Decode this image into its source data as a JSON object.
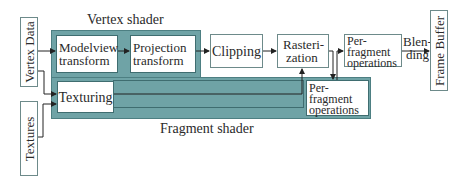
{
  "diagram": {
    "colors": {
      "shader_group_fill": "#6fa3a6",
      "shader_group_border": "#4d7f82",
      "box_fill": "#ffffff",
      "line": "#222222"
    },
    "inputs": {
      "vertex_data": "Vertex Data",
      "textures": "Textures"
    },
    "groups": {
      "vertex_shader": "Vertex shader",
      "fragment_shader": "Fragment shader"
    },
    "nodes": {
      "modelview": [
        "Modelview",
        "transform"
      ],
      "projection": [
        "Projection",
        "transform"
      ],
      "clipping": "Clipping",
      "rasterization": [
        "Rasteri-",
        "zation"
      ],
      "texturing": "Texturing",
      "per_fragment_inner": [
        "Per-",
        "fragment",
        "operations"
      ],
      "per_fragment_outer": [
        "Per-",
        "fragment",
        "operations"
      ],
      "blending": [
        "Blen-",
        "ding"
      ],
      "frame_buffer": "Frame Buffer"
    },
    "edges": [
      {
        "from": "Vertex Data",
        "to": "Modelview transform"
      },
      {
        "from": "Vertex Data",
        "to": "Texturing"
      },
      {
        "from": "Textures",
        "to": "Texturing"
      },
      {
        "from": "Modelview transform",
        "to": "Projection transform"
      },
      {
        "from": "Projection transform",
        "to": "Clipping"
      },
      {
        "from": "Clipping",
        "to": "Rasterization"
      },
      {
        "from": "Texturing",
        "to": "Rasterization"
      },
      {
        "from": "Rasterization",
        "to": "Per-fragment operations (fragment shader)"
      },
      {
        "from": "Per-fragment operations (fragment shader)",
        "to": "Per-fragment operations"
      },
      {
        "from": "Per-fragment operations",
        "to": "Frame Buffer",
        "label": "Blending"
      }
    ]
  }
}
